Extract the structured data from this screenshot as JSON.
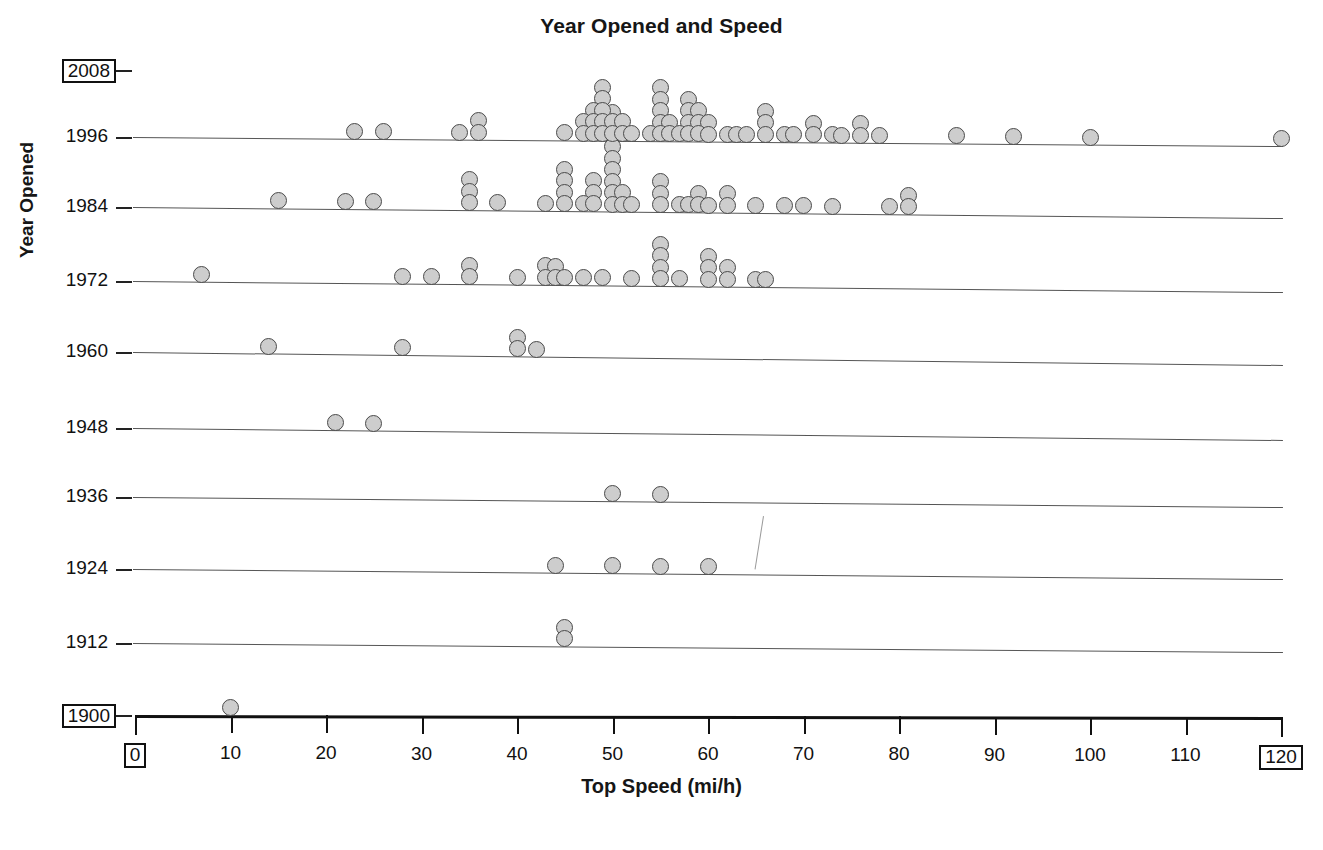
{
  "chart_data": {
    "type": "scatter",
    "plot_style": "stacked-dot-plot",
    "title": "Year Opened and Speed",
    "xlabel": "Top Speed (mi/h)",
    "ylabel": "Year Opened",
    "xlim": [
      0,
      120
    ],
    "ylim": [
      1900,
      2008
    ],
    "grid": false,
    "legend": false,
    "x_ticks": [
      0,
      10,
      20,
      30,
      40,
      50,
      60,
      70,
      80,
      90,
      100,
      110,
      120
    ],
    "x_tick_labels": [
      "0",
      "10",
      "20",
      "30",
      "40",
      "50",
      "60",
      "70",
      "80",
      "90",
      "100",
      "110",
      "120"
    ],
    "x_boxed_labels": [
      "0",
      "120"
    ],
    "y_ticks": [
      2008,
      1996,
      1984,
      1972,
      1960,
      1948,
      1936,
      1924,
      1912,
      1900
    ],
    "y_tick_labels": [
      "2008",
      "1996",
      "1984",
      "1972",
      "1960",
      "1948",
      "1936",
      "1924",
      "1912",
      "1900"
    ],
    "y_boxed_labels": [
      "2008",
      "1900"
    ],
    "marker": {
      "shape": "circle",
      "fill": "#cdcdcd",
      "edge": "#4a4a4a",
      "diameter_px": 17
    },
    "rows": [
      {
        "year": 2008,
        "counts": {}
      },
      {
        "year": 1996,
        "counts": {
          "23": 1,
          "26": 1,
          "34": 1,
          "36": 2,
          "45": 1,
          "47": 2,
          "48": 3,
          "49": 5,
          "50": 2,
          "51": 2,
          "52": 1,
          "54": 1,
          "55": 5,
          "56": 2,
          "57": 1,
          "58": 4,
          "59": 3,
          "60": 2,
          "62": 1,
          "63": 1,
          "64": 1,
          "66": 3,
          "68": 1,
          "69": 1,
          "71": 2,
          "73": 1,
          "74": 1,
          "76": 2,
          "78": 1,
          "86": 1,
          "92": 1,
          "100": 1,
          "120": 1
        }
      },
      {
        "year": 1984,
        "counts": {
          "15": 1,
          "22": 1,
          "25": 1,
          "35": 3,
          "38": 1,
          "43": 1,
          "45": 4,
          "47": 1,
          "48": 3,
          "50": 9,
          "51": 2,
          "52": 1,
          "55": 3,
          "57": 1,
          "58": 1,
          "59": 2,
          "60": 1,
          "62": 2,
          "65": 1,
          "68": 1,
          "70": 1,
          "73": 1,
          "79": 1,
          "81": 2
        }
      },
      {
        "year": 1972,
        "counts": {
          "7": 1,
          "28": 1,
          "31": 1,
          "35": 2,
          "40": 1,
          "43": 2,
          "44": 2,
          "45": 1,
          "47": 1,
          "49": 1,
          "52": 1,
          "55": 4,
          "57": 1,
          "60": 3,
          "62": 2,
          "65": 1,
          "66": 1
        }
      },
      {
        "year": 1960,
        "counts": {
          "14": 1,
          "28": 1,
          "40": 2,
          "42": 1
        }
      },
      {
        "year": 1948,
        "counts": {
          "21": 1,
          "25": 1
        }
      },
      {
        "year": 1936,
        "counts": {
          "50": 1,
          "55": 1
        }
      },
      {
        "year": 1924,
        "counts": {
          "44": 1,
          "50": 1,
          "55": 1,
          "60": 1
        }
      },
      {
        "year": 1912,
        "counts": {
          "45": 2
        }
      },
      {
        "year": 1900,
        "counts": {
          "10": 1
        }
      }
    ]
  },
  "annotations": {
    "stray_mark": "faint-diagonal-scan-artifact"
  }
}
